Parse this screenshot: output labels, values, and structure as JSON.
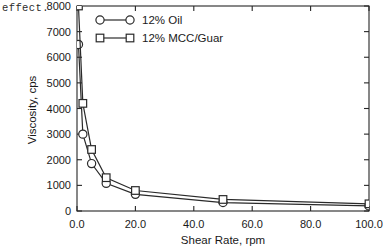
{
  "caption_fragment": "effect.",
  "chart_data": {
    "type": "line",
    "title": "",
    "xlabel": "Shear Rate, rpm",
    "ylabel": "Viscosity, cps",
    "xlim": [
      0,
      100
    ],
    "ylim": [
      0,
      8000
    ],
    "xticks": [
      "0.0",
      "20.0",
      "40.0",
      "60.0",
      "80.0",
      "100.0"
    ],
    "xtick_values": [
      0,
      20,
      40,
      60,
      80,
      100
    ],
    "yticks": [
      "0",
      "1000",
      "2000",
      "3000",
      "4000",
      "5000",
      "6000",
      "7000",
      "8000"
    ],
    "ytick_values": [
      0,
      1000,
      2000,
      3000,
      4000,
      5000,
      6000,
      7000,
      8000
    ],
    "grid": false,
    "legend_position": "upper-left-inside",
    "series": [
      {
        "name": "12% Oil",
        "marker": "circle",
        "x": [
          0.5,
          2,
          5,
          10,
          20,
          50,
          100
        ],
        "values": [
          6500,
          3000,
          1850,
          1080,
          650,
          330,
          200
        ]
      },
      {
        "name": "12% MCC/Guar",
        "marker": "square",
        "x": [
          0.5,
          2,
          5,
          10,
          20,
          50,
          100
        ],
        "values": [
          8000,
          4200,
          2400,
          1300,
          800,
          450,
          280
        ]
      }
    ]
  },
  "legend": {
    "entries": [
      {
        "label": "12% Oil",
        "marker": "circle"
      },
      {
        "label": "12% MCC/Guar",
        "marker": "square"
      }
    ]
  },
  "colors": {
    "axis": "#262626",
    "series": "#2a2a2a",
    "marker_fill": "#ffffff",
    "background": "#ffffff"
  }
}
